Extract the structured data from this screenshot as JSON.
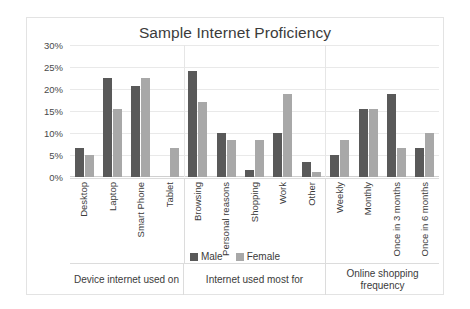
{
  "chart_data": {
    "type": "bar",
    "title": "Sample Internet Proficiency",
    "xlabel": "",
    "ylabel": "",
    "ylim": [
      0,
      30
    ],
    "ytick_labels": [
      "30%",
      "25%",
      "20%",
      "15%",
      "10%",
      "5%",
      "0%"
    ],
    "ytick_values": [
      30,
      25,
      20,
      15,
      10,
      5,
      0
    ],
    "grid": true,
    "legend_position": "bottom",
    "categories": [
      "Desktop",
      "Laptop",
      "Smart Phone",
      "Tablet",
      "Browsing",
      "Personal reasons",
      "Shopping",
      "Work",
      "Other",
      "Weekly",
      "Monthly",
      "Once in 3 months",
      "Once in 6 months"
    ],
    "series": [
      {
        "name": "Male",
        "color": "#595959",
        "values": [
          6.7,
          22.4,
          20.7,
          0,
          24.0,
          10.1,
          1.7,
          10.1,
          3.4,
          5.0,
          15.4,
          18.9,
          6.7
        ]
      },
      {
        "name": "Female",
        "color": "#a8a8a8",
        "values": [
          5.0,
          15.4,
          22.4,
          6.7,
          17.0,
          8.5,
          8.5,
          18.9,
          1.2,
          8.5,
          15.4,
          6.7,
          10.1
        ]
      }
    ],
    "groups": [
      {
        "label": "Device internet used on",
        "span": 4
      },
      {
        "label": "Internet used most for",
        "span": 5
      },
      {
        "label": "Online shopping frequency",
        "span": 4
      }
    ]
  }
}
